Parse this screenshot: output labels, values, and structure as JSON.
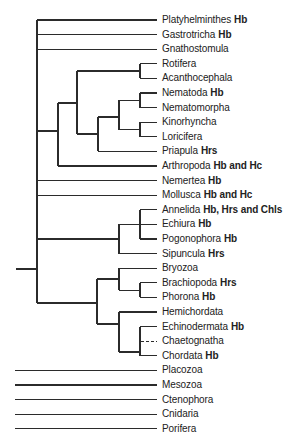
{
  "figure": {
    "type": "phylogenetic-tree",
    "line_color": "#2b2b2b",
    "text_color": "#222222"
  },
  "taxa": [
    {
      "name": "Platyhelminthes",
      "pigments": "Hb"
    },
    {
      "name": "Gastrotricha",
      "pigments": "Hb"
    },
    {
      "name": "Gnathostomula",
      "pigments": ""
    },
    {
      "name": "Rotifera",
      "pigments": ""
    },
    {
      "name": "Acanthocephala",
      "pigments": ""
    },
    {
      "name": "Nematoda",
      "pigments": "Hb"
    },
    {
      "name": "Nematomorpha",
      "pigments": ""
    },
    {
      "name": "Kinorhyncha",
      "pigments": ""
    },
    {
      "name": "Loricifera",
      "pigments": ""
    },
    {
      "name": "Priapula",
      "pigments": "Hrs"
    },
    {
      "name": "Arthropoda",
      "pigments": "Hb and Hc"
    },
    {
      "name": "Nemertea",
      "pigments": "Hb"
    },
    {
      "name": "Mollusca",
      "pigments": "Hb and Hc"
    },
    {
      "name": "Annelida",
      "pigments": "Hb, Hrs and Chls"
    },
    {
      "name": "Echiura",
      "pigments": "Hb"
    },
    {
      "name": "Pogonophora",
      "pigments": "Hb"
    },
    {
      "name": "Sipuncula",
      "pigments": "Hrs"
    },
    {
      "name": "Bryozoa",
      "pigments": ""
    },
    {
      "name": "Brachiopoda",
      "pigments": "Hrs"
    },
    {
      "name": "Phorona",
      "pigments": "Hb"
    },
    {
      "name": "Hemichordata",
      "pigments": ""
    },
    {
      "name": "Echinodermata",
      "pigments": "Hb"
    },
    {
      "name": "Chaetognatha",
      "pigments": "",
      "uncertain_placement": true
    },
    {
      "name": "Chordata",
      "pigments": "Hb"
    },
    {
      "name": "Placozoa",
      "pigments": ""
    },
    {
      "name": "Mesozoa",
      "pigments": ""
    },
    {
      "name": "Ctenophora",
      "pigments": ""
    },
    {
      "name": "Cnidaria",
      "pigments": ""
    },
    {
      "name": "Porifera",
      "pigments": ""
    }
  ],
  "clades": [
    {
      "members": [
        "Rotifera",
        "Acanthocephala"
      ]
    },
    {
      "members": [
        "Nematoda",
        "Nematomorpha"
      ]
    },
    {
      "members": [
        "Kinorhyncha",
        "Loricifera"
      ]
    },
    {
      "members": [
        "Nematoda",
        "Nematomorpha",
        "Kinorhyncha",
        "Loricifera"
      ]
    },
    {
      "members": [
        "Nematoda",
        "Nematomorpha",
        "Kinorhyncha",
        "Loricifera",
        "Priapula"
      ]
    },
    {
      "members": [
        "Rotifera",
        "Acanthocephala",
        "Nematoda",
        "Nematomorpha",
        "Kinorhyncha",
        "Loricifera",
        "Priapula"
      ]
    },
    {
      "members": [
        "Rotifera",
        "Acanthocephala",
        "Nematoda",
        "Nematomorpha",
        "Kinorhyncha",
        "Loricifera",
        "Priapula",
        "Arthropoda"
      ]
    },
    {
      "members": [
        "Annelida",
        "Echiura",
        "Pogonophora"
      ]
    },
    {
      "members": [
        "Annelida",
        "Echiura",
        "Pogonophora",
        "Sipuncula"
      ]
    },
    {
      "members": [
        "Brachiopoda",
        "Phorona"
      ]
    },
    {
      "members": [
        "Bryozoa",
        "Brachiopoda",
        "Phorona"
      ]
    },
    {
      "members": [
        "Echinodermata",
        "Chaetognatha",
        "Chordata"
      ]
    },
    {
      "members": [
        "Hemichordata",
        "Echinodermata",
        "Chaetognatha",
        "Chordata"
      ]
    },
    {
      "members": [
        "Bryozoa",
        "Brachiopoda",
        "Phorona",
        "Hemichordata",
        "Echinodermata",
        "Chaetognatha",
        "Chordata"
      ]
    }
  ],
  "unresolved_basal_taxa": [
    "Placozoa",
    "Mesozoa",
    "Ctenophora",
    "Cnidaria",
    "Porifera"
  ]
}
